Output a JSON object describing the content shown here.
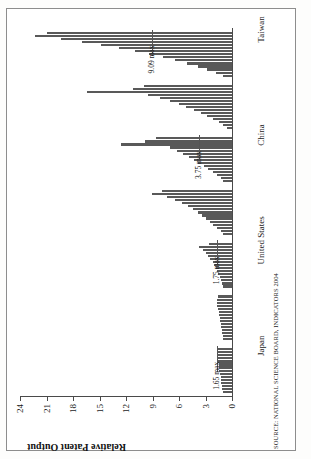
{
  "figure": {
    "note": "Normalized by 1989 value",
    "source": "SOURCE: NATIONAL SCIENCE BOARD, INDICATORS 2004"
  },
  "chart_data": {
    "type": "bar",
    "title": "",
    "xlabel": "",
    "ylabel": "Relative Patent Output",
    "ylim": [
      0,
      24
    ],
    "yticks": [
      0,
      3,
      6,
      9,
      12,
      15,
      18,
      21,
      24
    ],
    "ytick_labels": [
      "0",
      "3",
      "6",
      "9",
      "12",
      "15",
      "18",
      "21",
      "24"
    ],
    "grid": false,
    "legend": "none",
    "orientation": "page-rotated-90-ccw",
    "categories": [
      "Japan",
      "United States",
      "China",
      "Taiwan",
      "India",
      "Singapore",
      "South Korea"
    ],
    "annotations": [
      {
        "category": "Japan",
        "text": "1.65 max",
        "value": 1.65
      },
      {
        "category": "United States",
        "text": "1.75 max",
        "value": 1.75
      },
      {
        "category": "China",
        "text": "3.75 max",
        "value": 3.75
      },
      {
        "category": "Taiwan",
        "text": "9.09 max",
        "value": 9.09
      },
      {
        "category": "India",
        "text": "12.6 max",
        "value": 12.6
      },
      {
        "category": "Singapore",
        "text": "16.44 max",
        "value": 16.44
      },
      {
        "category": "South Korea",
        "text": "22.25 max",
        "value": 22.25
      }
    ],
    "bar_color": "#595959",
    "groups": [
      {
        "name": "Japan",
        "values": [
          1.0,
          1.08,
          1.14,
          1.2,
          1.26,
          1.3,
          1.36,
          1.42,
          1.46,
          1.5,
          1.55,
          1.6,
          1.65,
          1.62,
          1.55
        ]
      },
      {
        "name": "United States",
        "values": [
          1.0,
          1.04,
          1.1,
          1.16,
          1.2,
          1.27,
          1.33,
          1.4,
          1.46,
          1.52,
          1.6,
          1.68,
          1.75,
          1.7,
          1.62
        ]
      },
      {
        "name": "China",
        "values": [
          1.0,
          1.12,
          1.25,
          1.4,
          1.55,
          1.7,
          1.85,
          2.0,
          2.2,
          2.45,
          2.7,
          3.0,
          3.3,
          3.75,
          2.6
        ]
      },
      {
        "name": "Taiwan",
        "values": [
          1.0,
          1.3,
          1.7,
          2.1,
          2.5,
          2.9,
          3.4,
          3.9,
          4.4,
          5.0,
          5.7,
          6.5,
          7.4,
          9.09,
          7.9
        ]
      },
      {
        "name": "India",
        "values": [
          1.0,
          1.3,
          1.7,
          2.2,
          2.7,
          3.2,
          3.8,
          4.3,
          4.9,
          5.5,
          6.2,
          7.0,
          12.6,
          9.8,
          8.6
        ]
      },
      {
        "name": "Singapore",
        "values": [
          0.6,
          1.0,
          1.5,
          2.1,
          2.8,
          3.5,
          4.3,
          5.2,
          6.0,
          7.0,
          8.2,
          9.5,
          16.44,
          11.2,
          10.0
        ]
      },
      {
        "name": "South Korea",
        "values": [
          1.0,
          1.8,
          2.8,
          3.9,
          5.1,
          6.4,
          7.8,
          9.4,
          11.0,
          12.8,
          14.8,
          17.0,
          19.4,
          22.25,
          21.0
        ]
      }
    ]
  }
}
